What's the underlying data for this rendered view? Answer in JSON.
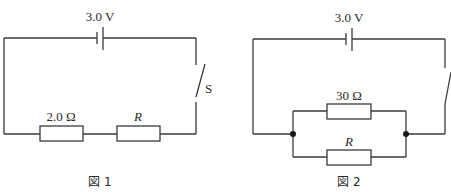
{
  "figures": [
    {
      "caption": "図 1",
      "battery_label": "3.0 V",
      "switch_label": "S",
      "connection": "series",
      "resistors": [
        {
          "label": "2.0 Ω"
        },
        {
          "label": "R"
        }
      ]
    },
    {
      "caption": "図 2",
      "battery_label": "3.0 V",
      "switch_label": "",
      "connection": "parallel",
      "resistors": [
        {
          "label": "30 Ω"
        },
        {
          "label": "R"
        }
      ]
    }
  ]
}
